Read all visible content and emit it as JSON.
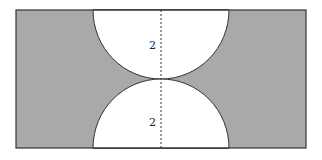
{
  "figure": {
    "shaded_color": "#a9a9a9",
    "outline_color": "#333333",
    "cutout_color": "#ffffff",
    "labels": {
      "top_radius": "2",
      "bottom_radius": "2"
    }
  }
}
